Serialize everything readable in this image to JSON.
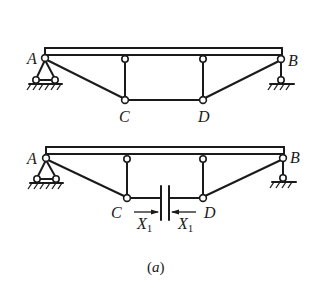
{
  "figure": {
    "caption": "(a)",
    "top_structure": {
      "labels": {
        "A": "A",
        "B": "B",
        "C": "C",
        "D": "D"
      }
    },
    "bottom_structure": {
      "labels": {
        "A": "A",
        "B": "B",
        "C": "C",
        "D": "D"
      },
      "redundant_force": {
        "symbol": "X",
        "subscript": "1"
      }
    }
  }
}
